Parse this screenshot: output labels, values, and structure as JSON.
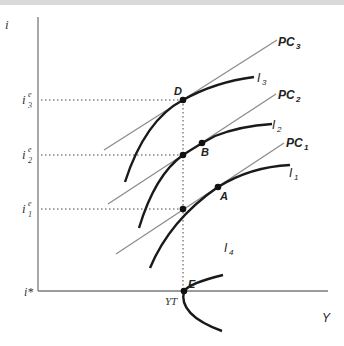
{
  "diagram": {
    "axes": {
      "y_label": "i",
      "x_label": "Y",
      "baseline_label": "i*",
      "x_marker_label": "YT"
    },
    "y_levels": [
      {
        "name": "i3e",
        "base": "i",
        "sub": "3",
        "sup": "e"
      },
      {
        "name": "i2e",
        "base": "i",
        "sub": "2",
        "sup": "e"
      },
      {
        "name": "i1e",
        "base": "i",
        "sub": "1",
        "sup": "e"
      }
    ],
    "pc_lines": [
      {
        "label": "PC",
        "sub": "3"
      },
      {
        "label": "PC",
        "sub": "2"
      },
      {
        "label": "PC",
        "sub": "1"
      }
    ],
    "indifference_curves": [
      {
        "label": "I",
        "sub": "3"
      },
      {
        "label": "I",
        "sub": "2"
      },
      {
        "label": "I",
        "sub": "1"
      },
      {
        "label": "I",
        "sub": "4"
      }
    ],
    "points": [
      {
        "label": "D"
      },
      {
        "label": "B"
      },
      {
        "label": "A"
      },
      {
        "label": "E"
      }
    ],
    "colors": {
      "curve": "#1a1a1a",
      "pc_line": "#8c8c8c",
      "axis": "#7a7a7a",
      "dotted": "#444444"
    }
  }
}
